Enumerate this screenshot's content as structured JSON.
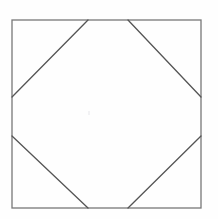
{
  "figure": {
    "background_color": "#fefefe",
    "stroke_color": "#555555",
    "square_stroke_color": "#777777",
    "stroke_width": 1.3,
    "square": {
      "name": "outer-square",
      "left": 12,
      "top": 20,
      "right": 201,
      "bottom": 208,
      "width": 189,
      "height": 188
    },
    "junctions": {
      "top_left_x": 88,
      "top_right_x": 128,
      "bottom_left_x": 88,
      "bottom_right_x": 128,
      "left_upper_y": 97,
      "left_lower_y": 136,
      "right_upper_y": 97,
      "right_lower_y": 136
    },
    "diagonals": [
      {
        "name": "top-left-diagonal",
        "x1": 12,
        "y1": 97,
        "x2": 88,
        "y2": 20
      },
      {
        "name": "top-right-diagonal",
        "x1": 128,
        "y1": 20,
        "x2": 201,
        "y2": 97
      },
      {
        "name": "bottom-right-diagonal",
        "x1": 201,
        "y1": 136,
        "x2": 128,
        "y2": 208
      },
      {
        "name": "bottom-left-diagonal",
        "x1": 88,
        "y1": 208,
        "x2": 12,
        "y2": 136
      }
    ],
    "octagon_points": "12,97 88,20 128,20 201,97 201,136 128,208 88,208 12,136"
  }
}
